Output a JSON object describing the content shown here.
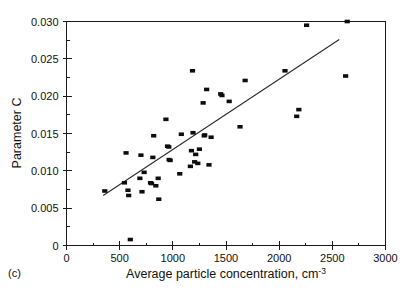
{
  "figure": {
    "panel_label": "(c)"
  },
  "chart_data": {
    "type": "scatter",
    "title": "",
    "subtitle": "",
    "xlabel": "Average particle concentration, cm",
    "xlabel_superscript": "-3",
    "ylabel": "Parameter C",
    "xlim": [
      0,
      3000
    ],
    "ylim": [
      0,
      0.03
    ],
    "grid": false,
    "legend_position": "none",
    "x_ticks": [
      0,
      500,
      1000,
      1500,
      2000,
      2500,
      3000
    ],
    "x_tick_labels": [
      "0",
      "500",
      "1000",
      "1500",
      "2000",
      "2500",
      "3000"
    ],
    "x_minor_step": 250,
    "y_ticks": [
      0,
      0.005,
      0.01,
      0.015,
      0.02,
      0.025,
      0.03
    ],
    "y_tick_labels": [
      "0",
      "0.005",
      "0.010",
      "0.015",
      "0.020",
      "0.025",
      "0.030"
    ],
    "y_minor_step": 0.0025,
    "series": [
      {
        "name": "Parameter C vs average particle concentration",
        "marker": "square",
        "color": "#0d0d0d",
        "points": [
          [
            360,
            0.0073
          ],
          [
            545,
            0.0084
          ],
          [
            560,
            0.0124
          ],
          [
            578,
            0.0074
          ],
          [
            585,
            0.0067
          ],
          [
            600,
            0.0008
          ],
          [
            690,
            0.009
          ],
          [
            700,
            0.0121
          ],
          [
            710,
            0.0072
          ],
          [
            730,
            0.0098
          ],
          [
            790,
            0.0084
          ],
          [
            800,
            0.0083
          ],
          [
            812,
            0.0118
          ],
          [
            820,
            0.0147
          ],
          [
            840,
            0.008
          ],
          [
            862,
            0.009
          ],
          [
            868,
            0.0062
          ],
          [
            935,
            0.0169
          ],
          [
            950,
            0.0133
          ],
          [
            962,
            0.0132
          ],
          [
            965,
            0.0115
          ],
          [
            975,
            0.0114
          ],
          [
            1065,
            0.0096
          ],
          [
            1080,
            0.0149
          ],
          [
            1165,
            0.0106
          ],
          [
            1175,
            0.0127
          ],
          [
            1185,
            0.0234
          ],
          [
            1190,
            0.0151
          ],
          [
            1205,
            0.0112
          ],
          [
            1215,
            0.0122
          ],
          [
            1235,
            0.011
          ],
          [
            1250,
            0.0129
          ],
          [
            1285,
            0.0191
          ],
          [
            1295,
            0.0147
          ],
          [
            1300,
            0.0148
          ],
          [
            1318,
            0.0209
          ],
          [
            1340,
            0.0108
          ],
          [
            1360,
            0.0145
          ],
          [
            1450,
            0.0203
          ],
          [
            1462,
            0.0201
          ],
          [
            1530,
            0.0193
          ],
          [
            1632,
            0.0159
          ],
          [
            1680,
            0.0221
          ],
          [
            2055,
            0.0234
          ],
          [
            2165,
            0.0173
          ],
          [
            2185,
            0.0182
          ],
          [
            2258,
            0.0295
          ],
          [
            2625,
            0.0227
          ],
          [
            2640,
            0.03
          ]
        ]
      }
    ],
    "fit_line": {
      "name": "linear regression",
      "x_start": 345,
      "y_start": 0.0067,
      "x_end": 2565,
      "y_end": 0.0276
    }
  }
}
